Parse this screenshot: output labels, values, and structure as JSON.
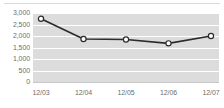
{
  "chart_data": {
    "type": "line",
    "title": "",
    "subtitle": "",
    "xlabel": "",
    "ylabel": "",
    "categories": [
      "12/03",
      "12/04",
      "12/05",
      "12/06",
      "12/07"
    ],
    "values": [
      2750,
      1870,
      1850,
      1680,
      2000
    ],
    "series": [
      {
        "name": "",
        "values": [
          2750,
          1870,
          1850,
          1680,
          2000
        ]
      }
    ],
    "ylim": [
      0,
      3000
    ],
    "yticks": [
      0,
      500,
      1000,
      1500,
      2000,
      2500,
      3000
    ],
    "ytick_labels": [
      "0",
      "500",
      "1,000",
      "1,500",
      "2,000",
      "2,500",
      "3,000"
    ],
    "xtick_labels": [
      "12/03",
      "12/04",
      "12/05",
      "12/06",
      "12/07"
    ],
    "grid": true,
    "grid_axis": "y",
    "legend": false,
    "legend_position": "none",
    "marker": "circle-open",
    "annotations": []
  },
  "style": {
    "plot_background": "#dcdcdc",
    "page_background": "#ffffff",
    "gridline_color": "#ffffff",
    "line_color": "#2b2b2b",
    "marker_fill": "#ffffff",
    "marker_stroke": "#2b2b2b",
    "axis_label_color": "#6e6e6e",
    "axis_line_color": "#c8c8c8"
  }
}
